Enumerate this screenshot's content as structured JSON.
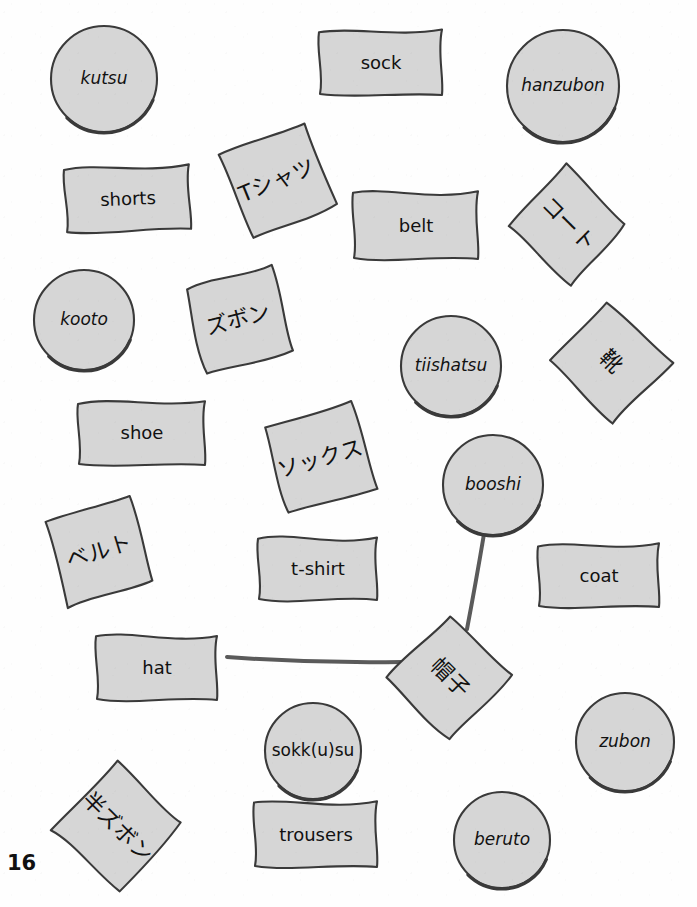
{
  "page": {
    "page_number": "16",
    "top_cutoff_text": "",
    "background_color": "#fefefe",
    "card_fill_color": "#d6d6d6",
    "card_stroke_color": "#3a3a3a",
    "text_color": "#111111",
    "connector_color": "#5a5a5a"
  },
  "cards": [
    {
      "id": "kutsu",
      "text": "kutsu",
      "kind": "romaji",
      "shape": "circle",
      "x": 48,
      "y": 23,
      "w": 112,
      "h": 112,
      "rot": 0
    },
    {
      "id": "sock",
      "text": "sock",
      "kind": "english",
      "shape": "wavy",
      "x": 317,
      "y": 28,
      "w": 128,
      "h": 70,
      "rot": 0
    },
    {
      "id": "hanzubon",
      "text": "hanzubon",
      "kind": "romaji",
      "shape": "circle",
      "x": 504,
      "y": 27,
      "w": 118,
      "h": 118,
      "rot": 0
    },
    {
      "id": "shorts",
      "text": "shorts",
      "kind": "english",
      "shape": "wavy",
      "x": 63,
      "y": 164,
      "w": 130,
      "h": 70,
      "rot": -2
    },
    {
      "id": "t-shatsu",
      "text": "Tシャツ",
      "kind": "jp",
      "shape": "square",
      "x": 229,
      "y": 133,
      "w": 96,
      "h": 96,
      "rot": -22
    },
    {
      "id": "belt",
      "text": "belt",
      "kind": "english",
      "shape": "wavy",
      "x": 351,
      "y": 190,
      "w": 130,
      "h": 72,
      "rot": 0
    },
    {
      "id": "kooto-jp",
      "text": "コート",
      "kind": "jp",
      "shape": "square",
      "x": 522,
      "y": 178,
      "w": 92,
      "h": 92,
      "rot": 45
    },
    {
      "id": "kooto",
      "text": "kooto",
      "kind": "romaji",
      "shape": "circle",
      "x": 31,
      "y": 267,
      "w": 106,
      "h": 106,
      "rot": 0
    },
    {
      "id": "zubon-jp",
      "text": "ズボン",
      "kind": "jp",
      "shape": "square",
      "x": 190,
      "y": 272,
      "w": 96,
      "h": 96,
      "rot": -14
    },
    {
      "id": "tiishatsu",
      "text": "tiishatsu",
      "kind": "romaji",
      "shape": "circle",
      "x": 398,
      "y": 313,
      "w": 106,
      "h": 106,
      "rot": 0
    },
    {
      "id": "kutsu-jp",
      "text": "靴",
      "kind": "jp",
      "shape": "square",
      "x": 565,
      "y": 316,
      "w": 92,
      "h": 92,
      "rot": 45
    },
    {
      "id": "shoe",
      "text": "shoe",
      "kind": "english",
      "shape": "wavy",
      "x": 76,
      "y": 398,
      "w": 132,
      "h": 70,
      "rot": 0
    },
    {
      "id": "sokkusu-jp",
      "text": "ソックス",
      "kind": "jp",
      "shape": "square",
      "x": 271,
      "y": 410,
      "w": 98,
      "h": 98,
      "rot": -16
    },
    {
      "id": "booshi",
      "text": "booshi",
      "kind": "romaji",
      "shape": "circle",
      "x": 440,
      "y": 432,
      "w": 106,
      "h": 106,
      "rot": 0
    },
    {
      "id": "beruto-jp",
      "text": "ベルト",
      "kind": "jp",
      "shape": "square",
      "x": 51,
      "y": 504,
      "w": 96,
      "h": 96,
      "rot": -17
    },
    {
      "id": "t-shirt",
      "text": "t-shirt",
      "kind": "english",
      "shape": "wavy",
      "x": 256,
      "y": 535,
      "w": 124,
      "h": 68,
      "rot": 0
    },
    {
      "id": "coat",
      "text": "coat",
      "kind": "english",
      "shape": "wavy",
      "x": 536,
      "y": 542,
      "w": 126,
      "h": 68,
      "rot": 0
    },
    {
      "id": "hat",
      "text": "hat",
      "kind": "english",
      "shape": "wavy",
      "x": 94,
      "y": 633,
      "w": 126,
      "h": 70,
      "rot": 0
    },
    {
      "id": "booshi-jp",
      "text": "帽子",
      "kind": "jp",
      "shape": "square",
      "x": 402,
      "y": 630,
      "w": 96,
      "h": 96,
      "rot": 45
    },
    {
      "id": "sokkusu",
      "text": "sokk(u)su",
      "kind": "romaji-up",
      "shape": "circle",
      "x": 262,
      "y": 700,
      "w": 102,
      "h": 102,
      "rot": 0
    },
    {
      "id": "zubon",
      "text": "zubon",
      "kind": "romaji",
      "shape": "circle",
      "x": 573,
      "y": 690,
      "w": 104,
      "h": 104,
      "rot": 0
    },
    {
      "id": "hanzubon-jp",
      "text": "半ズボン",
      "kind": "jp",
      "shape": "square",
      "x": 68,
      "y": 778,
      "w": 98,
      "h": 98,
      "rot": 45
    },
    {
      "id": "trousers",
      "text": "trousers",
      "kind": "english",
      "shape": "wavy",
      "x": 252,
      "y": 800,
      "w": 128,
      "h": 70,
      "rot": 0
    },
    {
      "id": "beruto",
      "text": "beruto",
      "kind": "romaji",
      "shape": "circle",
      "x": 451,
      "y": 789,
      "w": 102,
      "h": 102,
      "rot": 0
    }
  ],
  "connectors": [
    {
      "id": "booshi-to-booshi-jp",
      "from": "booshi",
      "to": "booshi-jp",
      "x1": 484,
      "y1": 534,
      "x2": 467,
      "y2": 629
    },
    {
      "id": "hat-to-booshi-jp",
      "from": "hat",
      "to": "booshi-jp",
      "x1": 227,
      "y1": 657,
      "x2": 402,
      "y2": 662
    }
  ]
}
